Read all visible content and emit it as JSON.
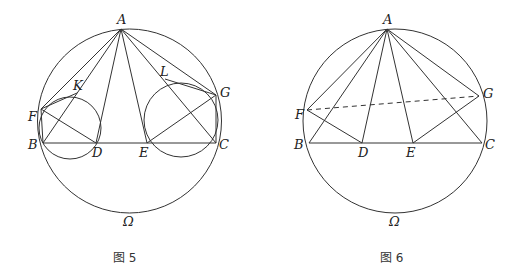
{
  "figures": [
    {
      "caption": "图 5",
      "circle_label": "Ω",
      "points": {
        "A": {
          "label": "A",
          "x": 121,
          "y": 29
        },
        "B": {
          "label": "B",
          "x": 43,
          "y": 143
        },
        "C": {
          "label": "C",
          "x": 216,
          "y": 143
        },
        "D": {
          "label": "D",
          "x": 96,
          "y": 143
        },
        "E": {
          "label": "E",
          "x": 147,
          "y": 143
        },
        "F": {
          "label": "F",
          "x": 41,
          "y": 109
        },
        "G": {
          "label": "G",
          "x": 216,
          "y": 95
        },
        "K": {
          "label": "K",
          "x": 77,
          "y": 93
        },
        "L": {
          "label": "L",
          "x": 165,
          "y": 79
        }
      }
    },
    {
      "caption": "图 6",
      "circle_label": "Ω",
      "points": {
        "A": {
          "label": "A",
          "x": 387,
          "y": 29
        },
        "B": {
          "label": "B",
          "x": 309,
          "y": 143
        },
        "C": {
          "label": "C",
          "x": 482,
          "y": 143
        },
        "D": {
          "label": "D",
          "x": 362,
          "y": 143
        },
        "E": {
          "label": "E",
          "x": 413,
          "y": 143
        },
        "F": {
          "label": "F",
          "x": 307,
          "y": 110
        },
        "G": {
          "label": "G",
          "x": 479,
          "y": 96
        }
      }
    }
  ]
}
